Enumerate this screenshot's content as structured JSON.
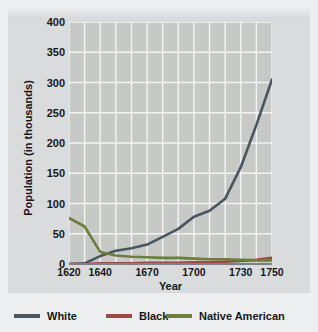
{
  "chart_data": {
    "type": "line",
    "title": "",
    "xlabel": "Year",
    "ylabel": "Population (in thousands)",
    "xlim": [
      1620,
      1750
    ],
    "ylim": [
      0,
      400
    ],
    "grid": true,
    "legend_position": "bottom",
    "xticks": [
      "1620",
      "1640",
      "1670",
      "1700",
      "1730",
      "1750"
    ],
    "xtick_values": [
      1620,
      1640,
      1670,
      1700,
      1730,
      1750
    ],
    "yticks": [
      "0",
      "50",
      "100",
      "150",
      "200",
      "250",
      "300",
      "350",
      "400"
    ],
    "ytick_values": [
      0,
      50,
      100,
      150,
      200,
      250,
      300,
      350,
      400
    ],
    "x": [
      1620,
      1630,
      1640,
      1650,
      1660,
      1670,
      1680,
      1690,
      1700,
      1710,
      1720,
      1730,
      1740,
      1750
    ],
    "series": [
      {
        "name": "White",
        "color": "#4a5560",
        "values": [
          0,
          1,
          13,
          22,
          26,
          32,
          45,
          58,
          78,
          88,
          108,
          160,
          230,
          305
        ]
      },
      {
        "name": "Black",
        "color": "#9d4a42",
        "values": [
          0,
          0,
          1,
          1,
          1,
          2,
          2,
          2,
          3,
          3,
          4,
          5,
          7,
          10
        ]
      },
      {
        "name": "Native American",
        "color": "#6e7d3c",
        "values": [
          76,
          62,
          20,
          14,
          12,
          11,
          10,
          10,
          9,
          8,
          8,
          7,
          6,
          6
        ]
      }
    ]
  },
  "legend": {
    "items": [
      {
        "label": "White",
        "color": "#4a5560"
      },
      {
        "label": "Black",
        "color": "#9d4a42"
      },
      {
        "label": "Native American",
        "color": "#6e7d3c"
      }
    ]
  }
}
